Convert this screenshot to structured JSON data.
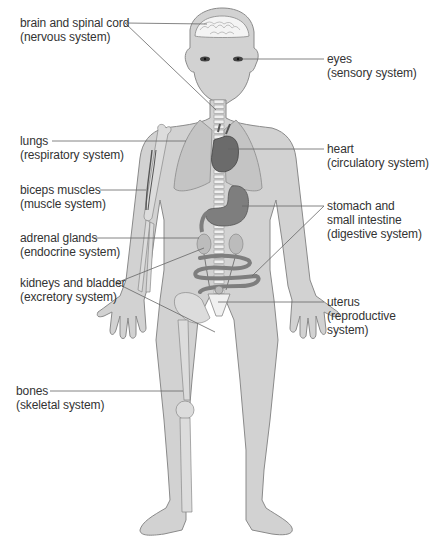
{
  "diagram": {
    "colors": {
      "body_fill": "#d2d2d2",
      "body_stroke": "#8a8a8a",
      "organ_dark": "#6b6b6b",
      "organ_mid": "#8c8c8c",
      "lung_fill": "#c4c4c4",
      "bone_fill": "#dcdcdc",
      "brain_fill": "#f4f4f4",
      "leader_line": "#666666",
      "text": "#333333"
    },
    "labels": [
      {
        "id": "brain",
        "name": "brain and spinal cord",
        "system": "(nervous system)",
        "side": "left"
      },
      {
        "id": "eyes",
        "name": "eyes",
        "system": "(sensory system)",
        "side": "right"
      },
      {
        "id": "lungs",
        "name": "lungs",
        "system": "(respiratory system)",
        "side": "left"
      },
      {
        "id": "heart",
        "name": "heart",
        "system": "(circulatory system)",
        "side": "right"
      },
      {
        "id": "biceps",
        "name": "biceps muscles",
        "system": "(muscle system)",
        "side": "left"
      },
      {
        "id": "stomach",
        "name": "stomach and",
        "name2": "small intestine",
        "system": "(digestive system)",
        "side": "right"
      },
      {
        "id": "adrenal",
        "name": "adrenal glands",
        "system": "(endocrine system)",
        "side": "left"
      },
      {
        "id": "kidneys",
        "name": "kidneys and bladder",
        "system": "(excretory system)",
        "side": "left"
      },
      {
        "id": "uterus",
        "name": "uterus",
        "system": "(reproductive",
        "system2": "system)",
        "side": "right"
      },
      {
        "id": "bones",
        "name": "bones",
        "system": "(skeletal system)",
        "side": "left"
      }
    ]
  }
}
